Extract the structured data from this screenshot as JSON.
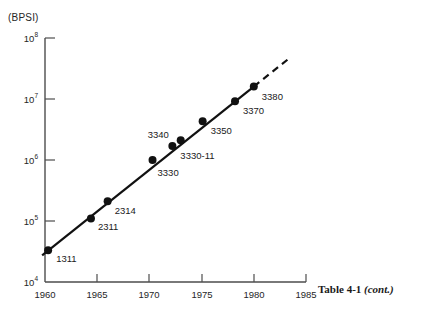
{
  "figure": {
    "unit_label": "(BPSI)",
    "caption_main": "Table 4-1",
    "caption_cont": "(cont.)"
  },
  "axes": {
    "y_ticks": [
      {
        "label": "10",
        "exp": "8",
        "value": 100000000
      },
      {
        "label": "10",
        "exp": "7",
        "value": 10000000
      },
      {
        "label": "10",
        "exp": "6",
        "value": 1000000
      },
      {
        "label": "10",
        "exp": "5",
        "value": 100000
      },
      {
        "label": "10",
        "exp": "4",
        "value": 10000
      }
    ],
    "x_ticks": [
      "1960",
      "1965",
      "1970",
      "1975",
      "1980",
      "1985"
    ]
  },
  "chart_data": {
    "type": "scatter",
    "title": "",
    "xlabel": "",
    "ylabel": "(BPSI)",
    "yscale": "log",
    "ylim": [
      10000,
      100000000
    ],
    "xlim": [
      1960,
      1985
    ],
    "grid": false,
    "legend": null,
    "annotations": [
      "dashed trend extension beyond 3380"
    ],
    "points": [
      {
        "label": "1311",
        "x": 1960.3,
        "y": 33000
      },
      {
        "label": "2311",
        "x": 1964.4,
        "y": 110000
      },
      {
        "label": "2314",
        "x": 1966.0,
        "y": 210000
      },
      {
        "label": "3330",
        "x": 1970.3,
        "y": 1000000
      },
      {
        "label": "3330-11",
        "x": 1972.2,
        "y": 1700000
      },
      {
        "label": "3340",
        "x": 1973.0,
        "y": 2100000
      },
      {
        "label": "3350",
        "x": 1975.1,
        "y": 4300000
      },
      {
        "label": "3370",
        "x": 1978.2,
        "y": 9200000
      },
      {
        "label": "3380",
        "x": 1980.0,
        "y": 16000000
      }
    ],
    "point_label_offsets": [
      {
        "label": "1311",
        "dx": 8,
        "dy": 10
      },
      {
        "label": "2311",
        "dx": 7,
        "dy": 10
      },
      {
        "label": "2314",
        "dx": 7,
        "dy": 11
      },
      {
        "label": "3330",
        "dx": 5,
        "dy": 14
      },
      {
        "label": "3330-11",
        "dx": 8,
        "dy": 11
      },
      {
        "label": "3340",
        "dx": -33,
        "dy": -4
      },
      {
        "label": "3350",
        "dx": 8,
        "dy": 11
      },
      {
        "label": "3370",
        "dx": 8,
        "dy": 11
      },
      {
        "label": "3380",
        "dx": 8,
        "dy": 11
      }
    ]
  },
  "colors": {
    "axis": "#4d4d4d",
    "marker": "#111111",
    "trend": "#111111",
    "text": "#222222",
    "background": "#ffffff"
  }
}
